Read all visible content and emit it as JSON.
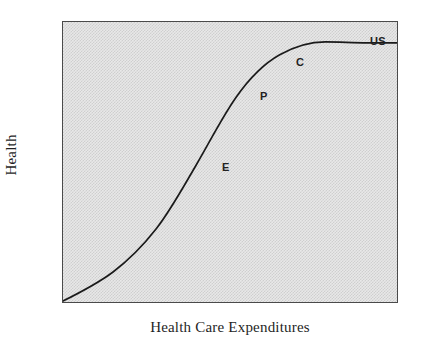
{
  "figure": {
    "background_color": "#ffffff",
    "plot_fill_color": "#d9d9d9",
    "plot_border_color": "#4a4a4a",
    "curve_color": "#1a1a1a"
  },
  "axes": {
    "x_title": "Health Care Expenditures",
    "y_title": "Health"
  },
  "chart_data": {
    "type": "line",
    "title": "",
    "subtitle": "",
    "xlabel": "Health Care Expenditures",
    "ylabel": "Health",
    "xlim": [
      0,
      100
    ],
    "ylim": [
      0,
      100
    ],
    "x_ticks": [],
    "y_ticks": [],
    "x_ticklabels": [],
    "y_ticklabels": [],
    "grid": false,
    "legend": false,
    "legend_position": "none",
    "series": [
      {
        "name": "Health production function",
        "shape": "sigmoid",
        "x": [
          0,
          5,
          10,
          15,
          20,
          25,
          30,
          35,
          40,
          45,
          50,
          55,
          60,
          65,
          70,
          75,
          80,
          85,
          90,
          95,
          100
        ],
        "y": [
          0,
          3,
          6,
          10,
          14,
          19,
          25,
          33,
          43,
          54,
          64,
          73,
          80,
          86,
          90,
          92.5,
          93.5,
          93.5,
          93.2,
          93.0,
          92.8
        ]
      }
    ],
    "annotations": [
      {
        "label": "E",
        "x": 48,
        "y": 50,
        "note": "point on steep rising segment"
      },
      {
        "label": "P",
        "x": 60,
        "y": 75,
        "note": "point higher on curve"
      },
      {
        "label": "C",
        "x": 71,
        "y": 87,
        "note": "point near the knee of the curve"
      },
      {
        "label": "US",
        "x": 93,
        "y": 93,
        "note": "point on the flat plateau at top right"
      }
    ]
  },
  "annotations_display": [
    {
      "label": "E",
      "left": 159,
      "top": 140
    },
    {
      "label": "P",
      "left": 197,
      "top": 69
    },
    {
      "label": "C",
      "left": 233,
      "top": 35
    },
    {
      "label": "US",
      "left": 307,
      "top": 14
    }
  ]
}
